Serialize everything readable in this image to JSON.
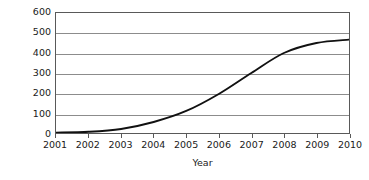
{
  "chart_data": {
    "type": "line",
    "title": "",
    "xlabel": "Year",
    "ylabel": "Number of Fairtrade Towns",
    "x": [
      2001,
      2002,
      2003,
      2004,
      2005,
      2006,
      2007,
      2008,
      2009,
      2010
    ],
    "categories": [
      "2001",
      "2002",
      "2003",
      "2004",
      "2005",
      "2006",
      "2007",
      "2008",
      "2009",
      "2010"
    ],
    "values": [
      2,
      6,
      20,
      55,
      110,
      195,
      300,
      400,
      450,
      467
    ],
    "series": [
      {
        "name": "Number of Fairtrade Towns",
        "values": [
          2,
          6,
          20,
          55,
          110,
          195,
          300,
          400,
          450,
          467
        ]
      }
    ],
    "xlim": [
      2001,
      2010
    ],
    "ylim": [
      0,
      600
    ],
    "ytick_labels": [
      "0",
      "100",
      "200",
      "300",
      "400",
      "500",
      "600"
    ],
    "yticks": [
      0,
      100,
      200,
      300,
      400,
      500,
      600
    ],
    "xtick_labels": [
      "2001",
      "2002",
      "2003",
      "2004",
      "2005",
      "2006",
      "2007",
      "2008",
      "2009",
      "2010"
    ],
    "grid": "horizontal",
    "legend": "none",
    "line_color": "#111111",
    "grid_color": "#8c8c8c",
    "frame_color": "#595959",
    "background_color": "#ffffff"
  }
}
